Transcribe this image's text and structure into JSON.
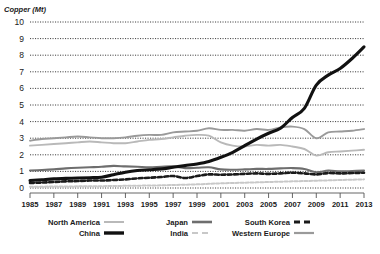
{
  "chart_data": {
    "type": "line",
    "title": "",
    "ylabel": "Copper (Mt)",
    "xlabel": "",
    "ylim": [
      0,
      10
    ],
    "xlim": [
      1985,
      2013
    ],
    "grid": true,
    "legend_position": "bottom",
    "ytick_labels": [
      "10",
      "9",
      "8",
      "7",
      "6",
      "5",
      "4",
      "3",
      "2",
      "1",
      "0"
    ],
    "ytick_values": [
      10,
      9,
      8,
      7,
      6,
      5,
      4,
      3,
      2,
      1,
      0
    ],
    "xtick_labels": [
      "1985",
      "1987",
      "1989",
      "1991",
      "1993",
      "1995",
      "1997",
      "1999",
      "2001",
      "2003",
      "2005",
      "2007",
      "2009",
      "2011",
      "2013"
    ],
    "xtick_values": [
      1985,
      1987,
      1989,
      1991,
      1993,
      1995,
      1997,
      1999,
      2001,
      2003,
      2005,
      2007,
      2009,
      2011,
      2013
    ],
    "x": [
      1985,
      1986,
      1987,
      1988,
      1989,
      1990,
      1991,
      1992,
      1993,
      1994,
      1995,
      1996,
      1997,
      1998,
      1999,
      2000,
      2001,
      2002,
      2003,
      2004,
      2005,
      2006,
      2007,
      2008,
      2009,
      2010,
      2011,
      2012,
      2013
    ],
    "series": [
      {
        "name": "North America",
        "color": "#b9b9b9",
        "style": "solid",
        "width": 1.9,
        "values": [
          2.55,
          2.6,
          2.65,
          2.7,
          2.75,
          2.8,
          2.75,
          2.7,
          2.7,
          2.8,
          2.9,
          2.95,
          3.05,
          3.15,
          3.2,
          3.15,
          2.75,
          2.55,
          2.5,
          2.6,
          2.55,
          2.6,
          2.5,
          2.35,
          1.95,
          2.15,
          2.2,
          2.25,
          2.3
        ]
      },
      {
        "name": "China",
        "color": "#111111",
        "style": "solid",
        "width": 3.1,
        "values": [
          0.45,
          0.5,
          0.55,
          0.58,
          0.6,
          0.62,
          0.65,
          0.8,
          0.95,
          1.05,
          1.1,
          1.15,
          1.25,
          1.35,
          1.45,
          1.6,
          1.85,
          2.15,
          2.55,
          2.95,
          3.3,
          3.6,
          4.25,
          4.8,
          6.2,
          6.8,
          7.2,
          7.8,
          8.5
        ]
      },
      {
        "name": "Japan",
        "color": "#6e6e6e",
        "style": "solid",
        "width": 2.1,
        "values": [
          1.05,
          1.08,
          1.12,
          1.18,
          1.22,
          1.25,
          1.28,
          1.33,
          1.3,
          1.28,
          1.25,
          1.28,
          1.3,
          1.2,
          1.22,
          1.25,
          1.12,
          1.1,
          1.12,
          1.15,
          1.15,
          1.18,
          1.2,
          1.15,
          0.95,
          1.05,
          1.0,
          1.02,
          1.05
        ]
      },
      {
        "name": "India",
        "color": "#c8c8c8",
        "style": "dashed",
        "width": 2.0,
        "values": [
          0.08,
          0.08,
          0.09,
          0.09,
          0.1,
          0.1,
          0.11,
          0.12,
          0.13,
          0.14,
          0.15,
          0.16,
          0.18,
          0.2,
          0.22,
          0.25,
          0.28,
          0.3,
          0.32,
          0.34,
          0.36,
          0.38,
          0.4,
          0.42,
          0.44,
          0.46,
          0.48,
          0.5,
          0.52
        ]
      },
      {
        "name": "South Korea",
        "color": "#1a1a1a",
        "style": "dashed",
        "width": 2.6,
        "values": [
          0.3,
          0.33,
          0.36,
          0.4,
          0.42,
          0.45,
          0.45,
          0.48,
          0.52,
          0.58,
          0.62,
          0.66,
          0.72,
          0.6,
          0.72,
          0.82,
          0.8,
          0.82,
          0.85,
          0.88,
          0.85,
          0.88,
          0.92,
          0.88,
          0.82,
          0.9,
          0.88,
          0.9,
          0.92
        ]
      },
      {
        "name": "Western Europe",
        "color": "#9a9a9a",
        "style": "solid",
        "width": 1.9,
        "values": [
          2.85,
          2.95,
          3.0,
          3.05,
          3.1,
          3.05,
          3.0,
          3.0,
          3.05,
          3.15,
          3.2,
          3.2,
          3.35,
          3.4,
          3.45,
          3.6,
          3.5,
          3.5,
          3.45,
          3.55,
          3.5,
          3.65,
          3.7,
          3.55,
          3.0,
          3.35,
          3.4,
          3.45,
          3.55
        ]
      }
    ],
    "legend": [
      {
        "label": "North America",
        "color": "#b9b9b9",
        "style": "solid",
        "width": 2.0
      },
      {
        "label": "China",
        "color": "#111111",
        "style": "solid",
        "width": 3.4
      },
      {
        "label": "Japan",
        "color": "#6e6e6e",
        "style": "solid",
        "width": 2.6
      },
      {
        "label": "India",
        "color": "#c8c8c8",
        "style": "dashed",
        "width": 2.2
      },
      {
        "label": "South Korea",
        "color": "#1a1a1a",
        "style": "dashed",
        "width": 3.0
      },
      {
        "label": "Western Europe",
        "color": "#9a9a9a",
        "style": "solid",
        "width": 2.2
      }
    ]
  }
}
